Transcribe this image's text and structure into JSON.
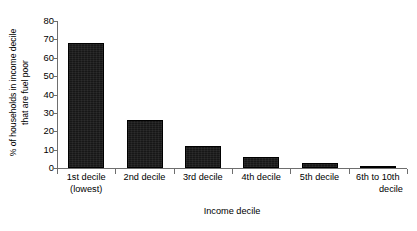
{
  "chart_data": {
    "type": "bar",
    "title": "",
    "subtitle": "",
    "xlabel": "Income decile",
    "ylabel": "% of households in income decile that are fuel poor",
    "ylabel_line1": "% of households in income decile",
    "ylabel_line2": "that are fuel poor",
    "categories": [
      "1st decile (lowest)",
      "2nd decile",
      "3rd decile",
      "4th decile",
      "5th decile",
      "6th to 10th decile"
    ],
    "category_lines": [
      [
        "1st decile",
        "(lowest)"
      ],
      [
        "2nd decile",
        ""
      ],
      [
        "3rd decile",
        ""
      ],
      [
        "4th decile",
        ""
      ],
      [
        "5th decile",
        ""
      ],
      [
        "6th to 10th",
        "decile"
      ]
    ],
    "values": [
      68,
      26,
      12,
      6,
      3,
      0.5
    ],
    "ylim": [
      0,
      80
    ],
    "ytick_values": [
      0,
      10,
      20,
      30,
      40,
      50,
      60,
      70,
      80
    ],
    "ytick_labels": [
      "0",
      "10",
      "20",
      "30",
      "40",
      "50",
      "60",
      "70",
      "80"
    ],
    "grid": false,
    "legend": false,
    "legend_position": "none",
    "bar_color": "#171717",
    "axis_color": "#6e6e6e",
    "background_color": "#ffffff"
  }
}
